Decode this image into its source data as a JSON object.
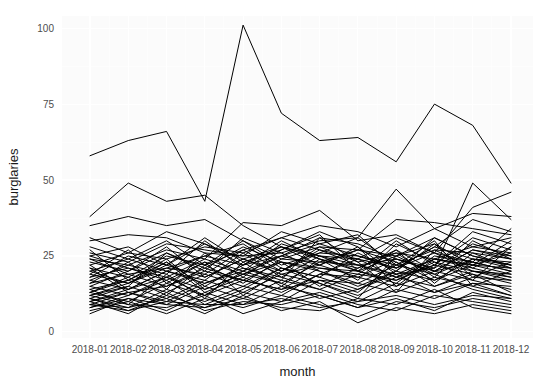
{
  "chart_data": {
    "type": "line",
    "title": "",
    "subtitle": "",
    "xlabel": "month",
    "ylabel": "burglaries",
    "grid": true,
    "legend": "none",
    "x": [
      "2018-01",
      "2018-02",
      "2018-03",
      "2018-04",
      "2018-05",
      "2018-06",
      "2018-07",
      "2018-08",
      "2018-09",
      "2018-10",
      "2018-11",
      "2018-12"
    ],
    "categories": [
      "2018-01",
      "2018-02",
      "2018-03",
      "2018-04",
      "2018-05",
      "2018-06",
      "2018-07",
      "2018-08",
      "2018-09",
      "2018-10",
      "2018-11",
      "2018-12"
    ],
    "xticklabels": [
      "2018-01",
      "2018-02",
      "2018-03",
      "2018-04",
      "2018-05",
      "2018-06",
      "2018-07",
      "2018-08",
      "2018-09",
      "2018-10",
      "2018-11",
      "2018-12"
    ],
    "yticklabels": [
      "0",
      "25",
      "50",
      "75",
      "100"
    ],
    "yticks": [
      0,
      25,
      50,
      75,
      100
    ],
    "ylim": [
      -2,
      104
    ],
    "xlim": [
      0,
      11
    ],
    "line_color": "#000000",
    "panel_color": "#fbfbfb",
    "grid_color": "#ffffff",
    "series": [
      {
        "name": "area-01",
        "values": [
          58,
          63,
          66,
          43,
          101,
          72,
          63,
          64,
          56,
          75,
          68,
          49
        ]
      },
      {
        "name": "area-02",
        "values": [
          38,
          49,
          43,
          45,
          35,
          28,
          25,
          22,
          24,
          21,
          49,
          37
        ]
      },
      {
        "name": "area-03",
        "values": [
          35,
          38,
          35,
          37,
          30,
          24,
          23,
          27,
          37,
          36,
          34,
          32
        ]
      },
      {
        "name": "area-04",
        "values": [
          30,
          32,
          31,
          26,
          25,
          26,
          30,
          31,
          47,
          34,
          39,
          38
        ]
      },
      {
        "name": "area-05",
        "values": [
          24,
          22,
          27,
          24,
          36,
          35,
          40,
          30,
          32,
          26,
          41,
          46
        ]
      },
      {
        "name": "area-06",
        "values": [
          22,
          26,
          24,
          28,
          26,
          31,
          35,
          33,
          28,
          34,
          28,
          26
        ]
      },
      {
        "name": "area-07",
        "values": [
          21,
          18,
          25,
          22,
          30,
          22,
          26,
          25,
          22,
          27,
          26,
          24
        ]
      },
      {
        "name": "area-08",
        "values": [
          20,
          24,
          20,
          25,
          22,
          28,
          24,
          21,
          26,
          24,
          22,
          26
        ]
      },
      {
        "name": "area-09",
        "values": [
          19,
          16,
          22,
          18,
          24,
          20,
          28,
          27,
          25,
          31,
          25,
          22
        ]
      },
      {
        "name": "area-10",
        "values": [
          18,
          21,
          17,
          23,
          19,
          25,
          22,
          18,
          24,
          20,
          27,
          25
        ]
      },
      {
        "name": "area-11",
        "values": [
          17,
          14,
          20,
          16,
          21,
          18,
          25,
          24,
          21,
          26,
          23,
          20
        ]
      },
      {
        "name": "area-12",
        "values": [
          16,
          19,
          15,
          21,
          17,
          23,
          20,
          16,
          22,
          19,
          24,
          23
        ]
      },
      {
        "name": "area-13",
        "values": [
          15,
          12,
          18,
          14,
          19,
          16,
          23,
          22,
          19,
          24,
          21,
          18
        ]
      },
      {
        "name": "area-14",
        "values": [
          14,
          17,
          13,
          19,
          15,
          21,
          18,
          14,
          20,
          17,
          22,
          21
        ]
      },
      {
        "name": "area-15",
        "values": [
          13,
          10,
          16,
          12,
          17,
          14,
          21,
          20,
          17,
          22,
          19,
          16
        ]
      },
      {
        "name": "area-16",
        "values": [
          12,
          15,
          11,
          17,
          13,
          19,
          16,
          12,
          18,
          15,
          20,
          19
        ]
      },
      {
        "name": "area-17",
        "values": [
          11,
          8,
          14,
          10,
          15,
          12,
          19,
          18,
          15,
          20,
          17,
          14
        ]
      },
      {
        "name": "area-18",
        "values": [
          10,
          13,
          9,
          15,
          11,
          17,
          14,
          10,
          16,
          13,
          18,
          17
        ]
      },
      {
        "name": "area-19",
        "values": [
          9,
          7,
          12,
          8,
          13,
          10,
          17,
          16,
          13,
          18,
          15,
          12
        ]
      },
      {
        "name": "area-20",
        "values": [
          8,
          11,
          7,
          13,
          9,
          15,
          12,
          8,
          14,
          11,
          16,
          15
        ]
      },
      {
        "name": "area-21",
        "values": [
          23,
          20,
          26,
          21,
          28,
          23,
          21,
          19,
          17,
          23,
          20,
          18
        ]
      },
      {
        "name": "area-22",
        "values": [
          26,
          23,
          29,
          27,
          25,
          33,
          29,
          25,
          21,
          28,
          24,
          21
        ]
      },
      {
        "name": "area-23",
        "values": [
          12,
          16,
          21,
          19,
          27,
          31,
          27,
          22,
          18,
          24,
          22,
          19
        ]
      },
      {
        "name": "area-24",
        "values": [
          9,
          13,
          10,
          16,
          20,
          25,
          31,
          29,
          24,
          20,
          27,
          24
        ]
      },
      {
        "name": "area-25",
        "values": [
          14,
          9,
          19,
          11,
          23,
          15,
          24,
          20,
          30,
          22,
          31,
          27
        ]
      },
      {
        "name": "area-26",
        "values": [
          25,
          21,
          18,
          24,
          20,
          29,
          25,
          20,
          16,
          25,
          23,
          20
        ]
      },
      {
        "name": "area-27",
        "values": [
          18,
          25,
          22,
          29,
          24,
          19,
          22,
          27,
          23,
          17,
          24,
          22
        ]
      },
      {
        "name": "area-28",
        "values": [
          11,
          15,
          26,
          20,
          31,
          26,
          20,
          15,
          20,
          29,
          18,
          23
        ]
      },
      {
        "name": "area-29",
        "values": [
          27,
          17,
          23,
          13,
          18,
          27,
          33,
          28,
          19,
          21,
          29,
          25
        ]
      },
      {
        "name": "area-30",
        "values": [
          16,
          23,
          14,
          26,
          18,
          13,
          19,
          24,
          31,
          26,
          20,
          17
        ]
      },
      {
        "name": "area-31",
        "values": [
          8,
          12,
          17,
          9,
          14,
          21,
          16,
          11,
          25,
          19,
          14,
          11
        ]
      },
      {
        "name": "area-32",
        "values": [
          13,
          18,
          12,
          22,
          16,
          24,
          28,
          23,
          13,
          27,
          21,
          28
        ]
      },
      {
        "name": "area-33",
        "values": [
          22,
          14,
          20,
          17,
          26,
          18,
          14,
          19,
          27,
          16,
          26,
          21
        ]
      },
      {
        "name": "area-34",
        "values": [
          19,
          27,
          16,
          23,
          12,
          20,
          26,
          31,
          22,
          30,
          15,
          20
        ]
      },
      {
        "name": "area-35",
        "values": [
          10,
          6,
          13,
          7,
          10,
          9,
          12,
          8,
          11,
          7,
          13,
          10
        ]
      },
      {
        "name": "area-36",
        "values": [
          7,
          10,
          6,
          11,
          8,
          12,
          9,
          5,
          10,
          8,
          11,
          9
        ]
      },
      {
        "name": "area-37",
        "values": [
          9,
          8,
          11,
          6,
          12,
          7,
          10,
          3,
          8,
          6,
          9,
          7
        ]
      },
      {
        "name": "area-38",
        "values": [
          12,
          9,
          8,
          12,
          6,
          10,
          13,
          9,
          7,
          12,
          10,
          8
        ]
      },
      {
        "name": "area-39",
        "values": [
          6,
          11,
          9,
          8,
          11,
          8,
          7,
          11,
          9,
          14,
          8,
          6
        ]
      },
      {
        "name": "area-40",
        "values": [
          11,
          7,
          10,
          9,
          9,
          11,
          8,
          10,
          12,
          9,
          12,
          11
        ]
      },
      {
        "name": "area-41",
        "values": [
          20,
          16,
          23,
          15,
          22,
          30,
          24,
          17,
          29,
          23,
          17,
          28
        ]
      },
      {
        "name": "area-42",
        "values": [
          24,
          19,
          21,
          25,
          29,
          21,
          18,
          26,
          20,
          31,
          25,
          22
        ]
      },
      {
        "name": "area-43",
        "values": [
          17,
          22,
          19,
          30,
          21,
          17,
          31,
          23,
          26,
          18,
          30,
          24
        ]
      },
      {
        "name": "area-44",
        "values": [
          15,
          20,
          28,
          18,
          24,
          28,
          22,
          28,
          15,
          24,
          28,
          31
        ]
      },
      {
        "name": "area-45",
        "values": [
          21,
          13,
          15,
          20,
          17,
          14,
          17,
          13,
          23,
          15,
          19,
          13
        ]
      },
      {
        "name": "area-46",
        "values": [
          28,
          24,
          30,
          22,
          27,
          20,
          27,
          24,
          18,
          22,
          33,
          29
        ]
      },
      {
        "name": "area-47",
        "values": [
          13,
          17,
          24,
          14,
          19,
          23,
          15,
          21,
          27,
          20,
          23,
          34
        ]
      },
      {
        "name": "area-48",
        "values": [
          10,
          14,
          18,
          12,
          20,
          16,
          11,
          14,
          19,
          13,
          16,
          12
        ]
      },
      {
        "name": "area-49",
        "values": [
          25,
          28,
          22,
          31,
          23,
          27,
          32,
          20,
          25,
          29,
          22,
          30
        ]
      },
      {
        "name": "area-50",
        "values": [
          31,
          26,
          33,
          29,
          22,
          25,
          29,
          32,
          21,
          28,
          37,
          33
        ]
      }
    ]
  }
}
